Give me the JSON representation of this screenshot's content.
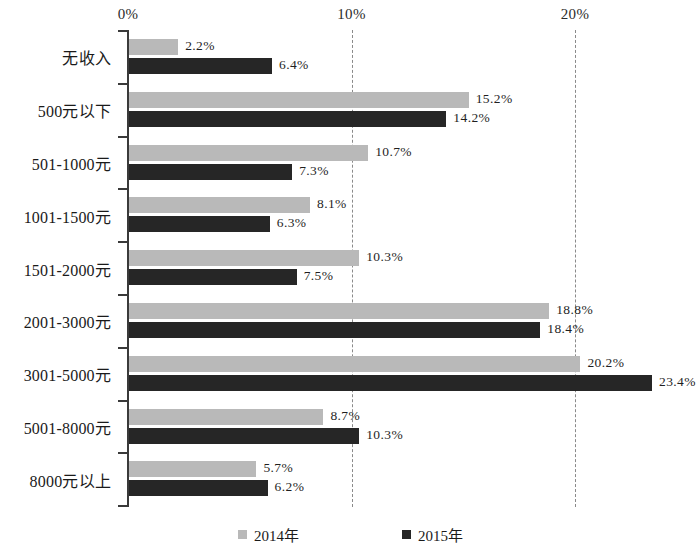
{
  "chart_data": {
    "type": "bar",
    "orientation": "horizontal",
    "title": "",
    "subtitle": "",
    "xlabel": "",
    "ylabel": "",
    "xlim": [
      0,
      26
    ],
    "grid": true,
    "gridlines_at": [
      10,
      20
    ],
    "axis_ticks": [
      "0%",
      "10%",
      "20%"
    ],
    "axis_tick_values": [
      0,
      10,
      20
    ],
    "legend_position": "bottom",
    "colors": {
      "series_2014": "#b9b9b9",
      "series_2015": "#262626",
      "axis": "#3a3a3a",
      "gridline": "#8a8a8a",
      "text": "#1a1a1a",
      "background": "#ffffff"
    },
    "categories": [
      "无收入",
      "500元以下",
      "501-1000元",
      "1001-1500元",
      "1501-2000元",
      "2001-3000元",
      "3001-5000元",
      "5001-8000元",
      "8000元以上"
    ],
    "series": [
      {
        "name": "2014年",
        "color": "#b9b9b9",
        "values": [
          2.2,
          15.2,
          10.7,
          8.1,
          10.3,
          18.8,
          20.2,
          8.7,
          5.7
        ],
        "labels": [
          "2.2%",
          "15.2%",
          "10.7%",
          "8.1%",
          "10.3%",
          "18.8%",
          "20.2%",
          "8.7%",
          "5.7%"
        ]
      },
      {
        "name": "2015年",
        "color": "#262626",
        "values": [
          6.4,
          14.2,
          7.3,
          6.3,
          7.5,
          18.4,
          23.4,
          10.3,
          6.2
        ],
        "labels": [
          "6.4%",
          "14.2%",
          "7.3%",
          "6.3%",
          "7.5%",
          "18.4%",
          "23.4%",
          "10.3%",
          "6.2%"
        ]
      }
    ]
  },
  "legend": {
    "items": [
      {
        "label": "2014年",
        "key": "s2014"
      },
      {
        "label": "2015年",
        "key": "s2015"
      }
    ]
  }
}
